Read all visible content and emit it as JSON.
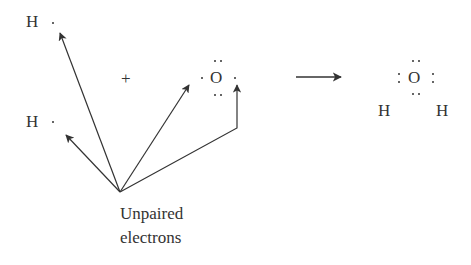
{
  "reactants": {
    "h1": {
      "symbol": "H"
    },
    "h2": {
      "symbol": "H"
    },
    "plus": "+",
    "oxygen": {
      "symbol": "O"
    }
  },
  "product": {
    "oxygen": {
      "symbol": "O"
    },
    "h_left": {
      "symbol": "H"
    },
    "h_right": {
      "symbol": "H"
    }
  },
  "annotation": {
    "line1": "Unpaired",
    "line2": "electrons"
  },
  "colors": {
    "ink": "#333333",
    "background": "#ffffff"
  }
}
